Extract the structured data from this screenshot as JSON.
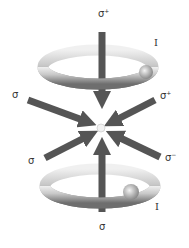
{
  "diagram": {
    "title": "",
    "type": "magneto-optical-trap",
    "beams": [
      {
        "id": "top",
        "label": "σ",
        "polarization": "+",
        "direction": "down"
      },
      {
        "id": "upper-left",
        "label": "σ",
        "polarization": "",
        "direction": "toward-center"
      },
      {
        "id": "upper-right",
        "label": "σ",
        "polarization": "+",
        "direction": "toward-center"
      },
      {
        "id": "lower-left",
        "label": "σ",
        "polarization": "",
        "direction": "toward-center"
      },
      {
        "id": "lower-right",
        "label": "σ",
        "polarization": "−",
        "direction": "toward-center"
      },
      {
        "id": "bottom",
        "label": "σ",
        "polarization": "",
        "direction": "up"
      }
    ],
    "coils": [
      {
        "id": "upper-coil",
        "current_label": "I"
      },
      {
        "id": "lower-coil",
        "current_label": "I"
      }
    ],
    "colors": {
      "beam": "#555555",
      "coil_light": "#e8e8e8",
      "coil_dark": "#7a7a7a",
      "center": "#f2f2f2"
    }
  }
}
